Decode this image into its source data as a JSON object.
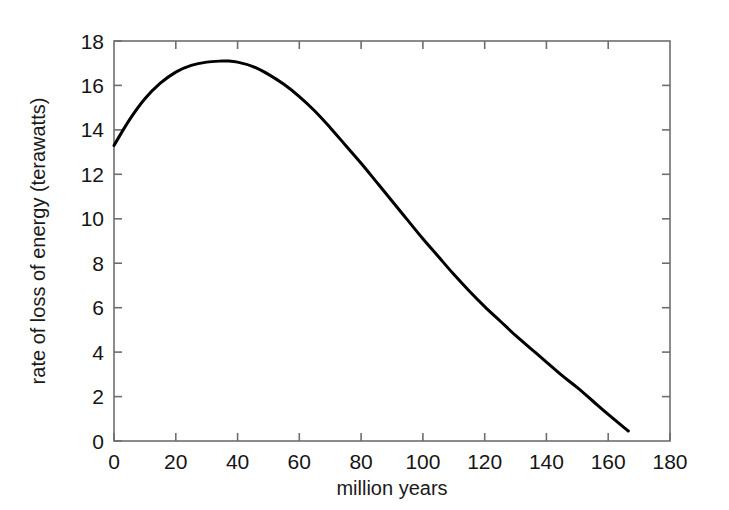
{
  "chart_data": {
    "type": "line",
    "title": "",
    "xlabel": "million years",
    "ylabel": "rate of loss of energy (terawatts)",
    "xlim": [
      0,
      180
    ],
    "ylim": [
      0,
      18
    ],
    "xticks": [
      0,
      20,
      40,
      60,
      80,
      100,
      120,
      140,
      160,
      180
    ],
    "yticks": [
      0,
      2,
      4,
      6,
      8,
      10,
      12,
      14,
      16,
      18
    ],
    "xtick_labels": [
      "0",
      "20",
      "40",
      "60",
      "80",
      "100",
      "120",
      "140",
      "160",
      "180"
    ],
    "ytick_labels": [
      "0",
      "2",
      "4",
      "6",
      "8",
      "10",
      "12",
      "14",
      "16",
      "18"
    ],
    "grid": false,
    "legend": null,
    "line_color": "#000000",
    "line_width": 3,
    "axis_color": "#6e6e6e",
    "background": "#ffffff",
    "series": [
      {
        "name": "rate of loss of energy",
        "x": [
          0,
          5,
          10,
          15,
          20,
          25,
          30,
          35,
          36.5,
          40,
          45,
          50,
          55,
          60,
          65,
          70,
          75,
          80,
          85,
          90,
          95,
          100,
          105,
          110,
          115,
          120,
          125,
          130,
          135,
          140,
          145,
          150,
          155,
          160,
          166.5
        ],
        "y": [
          13.3,
          14.45,
          15.4,
          16.1,
          16.6,
          16.9,
          17.05,
          17.1,
          17.1,
          17.05,
          16.85,
          16.5,
          16.05,
          15.5,
          14.85,
          14.1,
          13.3,
          12.5,
          11.65,
          10.8,
          9.95,
          9.1,
          8.3,
          7.5,
          6.75,
          6.05,
          5.4,
          4.75,
          4.15,
          3.55,
          2.95,
          2.4,
          1.8,
          1.2,
          0.45
        ]
      }
    ],
    "annotations": {
      "peak_x": 36.5,
      "peak_y": 17.1,
      "start_y": 13.3,
      "end_x": 166.5,
      "end_y": 0.45
    }
  },
  "plot_geometry": {
    "left": 114,
    "right": 670,
    "top": 41,
    "bottom": 441
  }
}
